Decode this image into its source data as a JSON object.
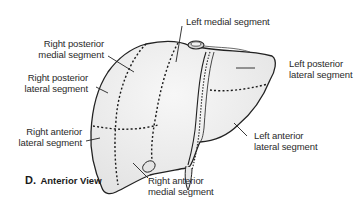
{
  "diagram": {
    "caption": {
      "letter": "D.",
      "view": "Anterior View"
    },
    "labels": {
      "left_medial": "Left medial segment",
      "right_posterior_medial_1": "Right posterior",
      "right_posterior_medial_2": "medial segment",
      "right_posterior_lateral_1": "Right posterior",
      "right_posterior_lateral_2": "lateral segment",
      "right_anterior_lateral_1": "Right anterior",
      "right_anterior_lateral_2": "lateral segment",
      "right_anterior_medial_1": "Right anterior",
      "right_anterior_medial_2": "medial segment",
      "left_posterior_lateral_1": "Left posterior",
      "left_posterior_lateral_2": "lateral segment",
      "left_anterior_lateral_1": "Left anterior",
      "left_anterior_lateral_2": "lateral segment"
    },
    "colors": {
      "liver_fill": "#ececec",
      "outline": "#222222",
      "dashes": "#1a1a1a",
      "text": "#2a2a2a"
    }
  }
}
